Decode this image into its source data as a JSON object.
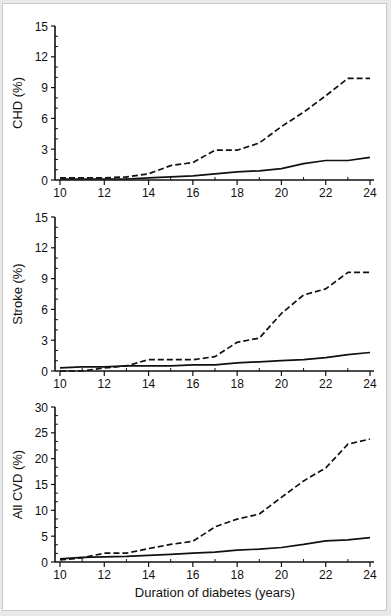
{
  "figure": {
    "xlabel": "Duration of diabetes (years)"
  },
  "chart_data": [
    {
      "type": "line",
      "title": "",
      "ylabel": "CHD (%)",
      "xlabel": "",
      "xlim": [
        10,
        24
      ],
      "ylim": [
        0,
        15
      ],
      "xticks": [
        10,
        12,
        14,
        16,
        18,
        20,
        22,
        24
      ],
      "yticks": [
        0,
        3,
        6,
        9,
        12,
        15
      ],
      "x": [
        10,
        11,
        12,
        13,
        14,
        15,
        16,
        17,
        18,
        19,
        20,
        21,
        22,
        23,
        24
      ],
      "series": [
        {
          "name": "dashed",
          "style": "dashed",
          "values": [
            0.2,
            0.2,
            0.2,
            0.3,
            0.6,
            1.4,
            1.7,
            2.9,
            2.9,
            3.6,
            5.2,
            6.6,
            8.2,
            9.9,
            9.9
          ]
        },
        {
          "name": "solid",
          "style": "solid",
          "values": [
            0.1,
            0.1,
            0.1,
            0.1,
            0.2,
            0.3,
            0.4,
            0.6,
            0.8,
            0.9,
            1.1,
            1.6,
            1.9,
            1.9,
            2.2
          ]
        }
      ],
      "grid": false,
      "legend": "none"
    },
    {
      "type": "line",
      "title": "",
      "ylabel": "Stroke (%)",
      "xlabel": "",
      "xlim": [
        10,
        24
      ],
      "ylim": [
        0,
        15
      ],
      "xticks": [
        10,
        12,
        14,
        16,
        18,
        20,
        22,
        24
      ],
      "yticks": [
        0,
        3,
        6,
        9,
        12,
        15
      ],
      "x": [
        10,
        11,
        12,
        13,
        14,
        15,
        16,
        17,
        18,
        19,
        20,
        21,
        22,
        23,
        24
      ],
      "series": [
        {
          "name": "dashed",
          "style": "dashed",
          "values": [
            0.0,
            0.0,
            0.3,
            0.5,
            1.1,
            1.1,
            1.1,
            1.4,
            2.8,
            3.2,
            5.6,
            7.4,
            8.0,
            9.6,
            9.6
          ]
        },
        {
          "name": "solid",
          "style": "solid",
          "values": [
            0.3,
            0.4,
            0.4,
            0.5,
            0.5,
            0.5,
            0.6,
            0.6,
            0.8,
            0.9,
            1.0,
            1.1,
            1.3,
            1.6,
            1.8
          ]
        }
      ],
      "grid": false,
      "legend": "none"
    },
    {
      "type": "line",
      "title": "",
      "ylabel": "All CVD (%)",
      "xlabel": "Duration of diabetes (years)",
      "xlim": [
        10,
        24
      ],
      "ylim": [
        0,
        30
      ],
      "xticks": [
        10,
        12,
        14,
        16,
        18,
        20,
        22,
        24
      ],
      "yticks": [
        0,
        5,
        10,
        15,
        20,
        25,
        30
      ],
      "x": [
        10,
        11,
        12,
        13,
        14,
        15,
        16,
        17,
        18,
        19,
        20,
        21,
        22,
        23,
        24
      ],
      "series": [
        {
          "name": "dashed",
          "style": "dashed",
          "values": [
            0.4,
            0.8,
            1.7,
            1.7,
            2.6,
            3.4,
            4.0,
            6.8,
            8.3,
            9.3,
            12.5,
            15.7,
            18.2,
            22.8,
            23.8
          ]
        },
        {
          "name": "solid",
          "style": "solid",
          "values": [
            0.6,
            0.9,
            1.0,
            1.1,
            1.3,
            1.5,
            1.7,
            1.9,
            2.3,
            2.5,
            2.8,
            3.4,
            4.1,
            4.3,
            4.7
          ]
        }
      ],
      "grid": false,
      "legend": "none"
    }
  ]
}
